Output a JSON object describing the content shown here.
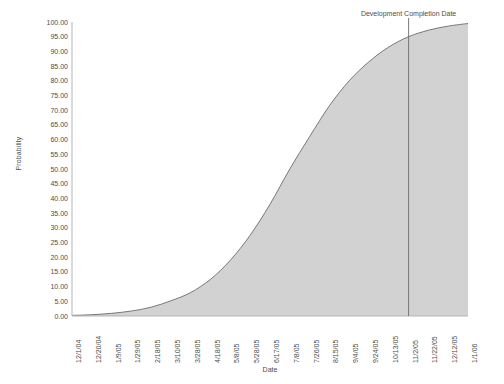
{
  "chart_data": {
    "type": "area",
    "title": "",
    "xlabel": "Date",
    "ylabel": "Probability",
    "grid": false,
    "legend": "none",
    "ylim": [
      0,
      100
    ],
    "ytick_labels": [
      "0.00",
      "5.00",
      "10.00",
      "15.00",
      "20.00",
      "25.00",
      "30.00",
      "35.00",
      "40.00",
      "45.00",
      "50.00",
      "55.00",
      "60.00",
      "65.00",
      "70.00",
      "75.00",
      "80.00",
      "85.00",
      "90.00",
      "95.00",
      "100.00"
    ],
    "ytick_values": [
      0,
      5,
      10,
      15,
      20,
      25,
      30,
      35,
      40,
      45,
      50,
      55,
      60,
      65,
      70,
      75,
      80,
      85,
      90,
      95,
      100
    ],
    "categories": [
      "12/1/04",
      "12/20/04",
      "1/9/05",
      "1/29/05",
      "2/18/05",
      "3/10/05",
      "3/28/05",
      "4/18/05",
      "5/8/05",
      "5/28/05",
      "6/17/05",
      "7/8/05",
      "7/26/05",
      "8/15/05",
      "9/4/05",
      "9/24/05",
      "10/13/05",
      "11/2/05",
      "11/22/05",
      "12/12/05",
      "1/1/06"
    ],
    "series": [
      {
        "name": "Cumulative Probability",
        "values": [
          0.2,
          0.45,
          0.9,
          1.7,
          3.0,
          5.2,
          8.0,
          12.5,
          19.0,
          27.5,
          38.0,
          50.0,
          61.0,
          71.5,
          80.0,
          86.5,
          91.5,
          95.0,
          97.2,
          98.6,
          99.5
        ]
      }
    ],
    "annotations": [
      {
        "label": "Development Completion Date",
        "type": "vertical-line",
        "at_category": "11/2/05",
        "at_index": 17,
        "value_at_line": 95.0
      }
    ],
    "colors": {
      "area_fill": "#d2d2d2",
      "curve_line": "#6b6b6b",
      "axis_line": "#b5b5b5",
      "annotation_line": "#6b6b6b",
      "text": "#4d4d4d",
      "background": "#ffffff"
    }
  }
}
